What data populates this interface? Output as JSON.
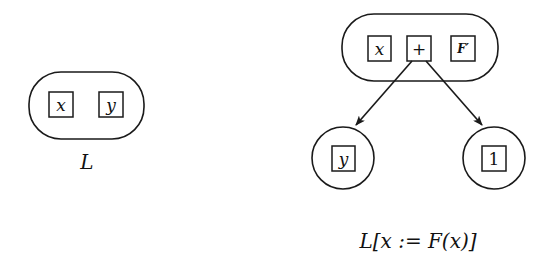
{
  "diagram": {
    "left": {
      "container_shape": "rounded-rectangle",
      "cells": [
        "x",
        "y"
      ],
      "caption": "L"
    },
    "right": {
      "container_shape": "rounded-rectangle",
      "cells": [
        "x",
        "+",
        "F′"
      ],
      "children": [
        {
          "shape": "circle",
          "cell": "y",
          "parent_cell": "+"
        },
        {
          "shape": "circle",
          "cell": "1",
          "parent_cell": "+"
        }
      ],
      "caption": "L[x := F(x)]"
    },
    "colors": {
      "stroke": "#1a1a1a",
      "background": "#ffffff"
    }
  }
}
